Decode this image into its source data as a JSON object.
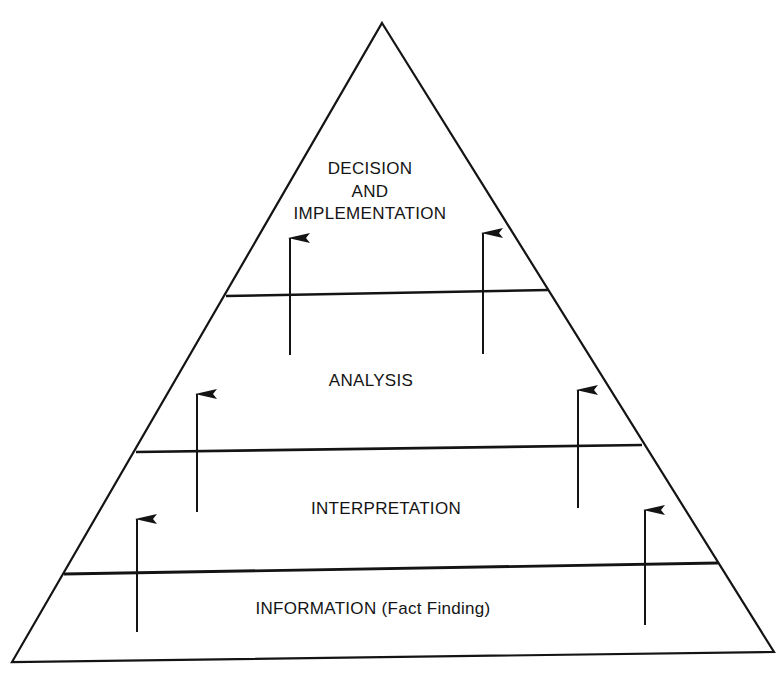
{
  "diagram": {
    "type": "pyramid",
    "colors": {
      "ink": "#141414",
      "background": "#ffffff"
    },
    "levels": [
      {
        "id": "decision",
        "lines": [
          "DECISION",
          "AND",
          "IMPLEMENTATION"
        ]
      },
      {
        "id": "analysis",
        "lines": [
          "ANALYSIS"
        ]
      },
      {
        "id": "interpretation",
        "lines": [
          "INTERPRETATION"
        ]
      },
      {
        "id": "information",
        "lines": [
          "INFORMATION (Fact Finding)"
        ]
      }
    ],
    "arrows_direction": "up",
    "arrows_per_boundary": 2
  }
}
